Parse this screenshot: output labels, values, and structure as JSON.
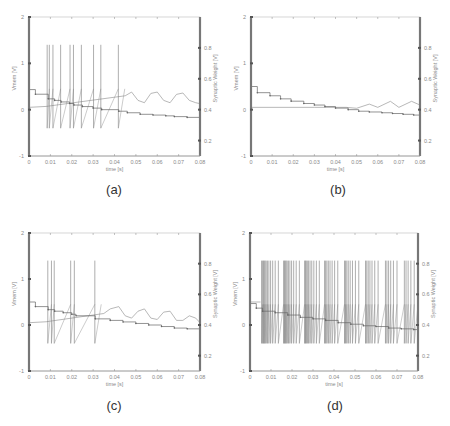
{
  "figure": {
    "captions": [
      "(a)",
      "(b)",
      "(c)",
      "(d)"
    ]
  },
  "chart_data": [
    {
      "id": "a",
      "type": "line",
      "caption": "(a)",
      "xlabel": "time [s]",
      "ylabel": "Vmem [V]",
      "ylabel_right": "Synaptic Weight [V]",
      "xlim": [
        0,
        0.08
      ],
      "ylim": [
        -1,
        2
      ],
      "ylim_right": [
        0.1,
        1.0
      ],
      "xticks": [
        "0",
        "0.01",
        "0.02",
        "0.03",
        "0.04",
        "0.05",
        "0.06",
        "0.07",
        "0.08"
      ],
      "yticks": [
        "-1",
        "0",
        "1",
        "2"
      ],
      "yticks_right": [
        "0.2",
        "0.4",
        "0.6",
        "0.8"
      ],
      "grid": false,
      "legend": null,
      "series": [
        {
          "name": "Vmem",
          "axis": "left",
          "spike_times": [
            0.0085,
            0.0095,
            0.0112,
            0.0148,
            0.0192,
            0.0208,
            0.0245,
            0.0302,
            0.0336,
            0.0418
          ],
          "spike_peak": 1.4,
          "spike_trough": -0.4,
          "baseline": [
            [
              0,
              0.05
            ],
            [
              0.008,
              0.07
            ],
            [
              0.045,
              0.3
            ],
            [
              0.048,
              0.38
            ],
            [
              0.051,
              0.2
            ],
            [
              0.054,
              0.15
            ],
            [
              0.057,
              0.35
            ],
            [
              0.06,
              0.38
            ],
            [
              0.063,
              0.2
            ],
            [
              0.066,
              0.15
            ],
            [
              0.069,
              0.33
            ],
            [
              0.072,
              0.36
            ],
            [
              0.075,
              0.2
            ],
            [
              0.078,
              0.15
            ],
            [
              0.08,
              0.13
            ]
          ]
        },
        {
          "name": "Synaptic Weight",
          "axis": "right",
          "steps": [
            [
              0,
              0.53
            ],
            [
              0.003,
              0.5
            ],
            [
              0.009,
              0.47
            ],
            [
              0.012,
              0.46
            ],
            [
              0.015,
              0.45
            ],
            [
              0.019,
              0.44
            ],
            [
              0.021,
              0.43
            ],
            [
              0.025,
              0.42
            ],
            [
              0.03,
              0.41
            ],
            [
              0.034,
              0.4
            ],
            [
              0.042,
              0.39
            ],
            [
              0.046,
              0.38
            ],
            [
              0.052,
              0.37
            ],
            [
              0.058,
              0.365
            ],
            [
              0.064,
              0.36
            ],
            [
              0.068,
              0.355
            ],
            [
              0.074,
              0.35
            ],
            [
              0.08,
              0.345
            ]
          ]
        }
      ]
    },
    {
      "id": "b",
      "type": "line",
      "caption": "(b)",
      "xlabel": "time [s]",
      "ylabel": "Vmem [V]",
      "ylabel_right": "Synaptic Weight [V]",
      "xlim": [
        0,
        0.08
      ],
      "ylim": [
        -1,
        2
      ],
      "ylim_right": [
        0.1,
        1.0
      ],
      "xticks": [
        "0",
        "0.01",
        "0.02",
        "0.03",
        "0.04",
        "0.05",
        "0.06",
        "0.07",
        "0.08"
      ],
      "yticks": [
        "-1",
        "0",
        "1",
        "2"
      ],
      "yticks_right": [
        "0.2",
        "0.4",
        "0.6",
        "0.8"
      ],
      "grid": false,
      "legend": null,
      "series": [
        {
          "name": "Vmem",
          "axis": "left",
          "spike_times": [],
          "spike_peak": 1.4,
          "spike_trough": -0.4,
          "baseline": [
            [
              0,
              0.05
            ],
            [
              0.03,
              0.05
            ],
            [
              0.045,
              0.05
            ],
            [
              0.05,
              0.03
            ],
            [
              0.056,
              0.12
            ],
            [
              0.06,
              0.05
            ],
            [
              0.066,
              0.18
            ],
            [
              0.07,
              0.05
            ],
            [
              0.076,
              0.18
            ],
            [
              0.08,
              0.1
            ]
          ]
        },
        {
          "name": "Synaptic Weight",
          "axis": "right",
          "steps": [
            [
              0,
              0.55
            ],
            [
              0.003,
              0.51
            ],
            [
              0.009,
              0.49
            ],
            [
              0.014,
              0.47
            ],
            [
              0.019,
              0.455
            ],
            [
              0.025,
              0.44
            ],
            [
              0.03,
              0.43
            ],
            [
              0.035,
              0.42
            ],
            [
              0.04,
              0.41
            ],
            [
              0.046,
              0.4
            ],
            [
              0.051,
              0.39
            ],
            [
              0.056,
              0.385
            ],
            [
              0.062,
              0.38
            ],
            [
              0.067,
              0.375
            ],
            [
              0.072,
              0.37
            ],
            [
              0.077,
              0.365
            ],
            [
              0.08,
              0.36
            ]
          ]
        }
      ]
    },
    {
      "id": "c",
      "type": "line",
      "caption": "(c)",
      "xlabel": "time [s]",
      "ylabel": "Vmem [V]",
      "ylabel_right": "Synaptic Weight [V]",
      "xlim": [
        0,
        0.08
      ],
      "ylim": [
        -1,
        2
      ],
      "ylim_right": [
        0.1,
        1.0
      ],
      "xticks": [
        "0",
        "0.01",
        "0.02",
        "0.03",
        "0.04",
        "0.05",
        "0.06",
        "0.07",
        "0.08"
      ],
      "yticks": [
        "-1",
        "0",
        "1",
        "2"
      ],
      "yticks_right": [
        "0.2",
        "0.4",
        "0.6",
        "0.8"
      ],
      "grid": false,
      "legend": null,
      "series": [
        {
          "name": "Vmem",
          "axis": "left",
          "spike_times": [
            0.0088,
            0.0105,
            0.0118,
            0.0195,
            0.0212,
            0.0308
          ],
          "spike_peak": 1.4,
          "spike_trough": -0.4,
          "baseline": [
            [
              0,
              0.05
            ],
            [
              0.008,
              0.07
            ],
            [
              0.035,
              0.25
            ],
            [
              0.038,
              0.35
            ],
            [
              0.042,
              0.4
            ],
            [
              0.045,
              0.2
            ],
            [
              0.048,
              0.15
            ],
            [
              0.051,
              0.3
            ],
            [
              0.054,
              0.35
            ],
            [
              0.057,
              0.15
            ],
            [
              0.06,
              0.12
            ],
            [
              0.063,
              0.28
            ],
            [
              0.066,
              0.3
            ],
            [
              0.069,
              0.1
            ],
            [
              0.072,
              0.1
            ],
            [
              0.075,
              0.2
            ],
            [
              0.078,
              0.15
            ],
            [
              0.08,
              0.05
            ]
          ]
        },
        {
          "name": "Synaptic Weight",
          "axis": "right",
          "steps": [
            [
              0,
              0.55
            ],
            [
              0.003,
              0.52
            ],
            [
              0.009,
              0.5
            ],
            [
              0.012,
              0.49
            ],
            [
              0.016,
              0.48
            ],
            [
              0.02,
              0.47
            ],
            [
              0.022,
              0.46
            ],
            [
              0.031,
              0.44
            ],
            [
              0.038,
              0.43
            ],
            [
              0.044,
              0.42
            ],
            [
              0.05,
              0.41
            ],
            [
              0.056,
              0.4
            ],
            [
              0.062,
              0.39
            ],
            [
              0.068,
              0.38
            ],
            [
              0.074,
              0.375
            ],
            [
              0.08,
              0.37
            ]
          ]
        }
      ]
    },
    {
      "id": "d",
      "type": "line",
      "caption": "(d)",
      "xlabel": "time [s]",
      "ylabel": "Vmem [V]",
      "ylabel_right": "Synaptic Weight [V]",
      "xlim": [
        0,
        0.08
      ],
      "ylim": [
        -1,
        2
      ],
      "ylim_right": [
        0.1,
        1.0
      ],
      "xticks": [
        "0",
        "0.01",
        "0.02",
        "0.03",
        "0.04",
        "0.05",
        "0.06",
        "0.07",
        "0.08"
      ],
      "yticks": [
        "-1",
        "0",
        "1",
        "2"
      ],
      "yticks_right": [
        "0.2",
        "0.4",
        "0.6",
        "0.8"
      ],
      "grid": false,
      "legend": null,
      "series": [
        {
          "name": "Vmem",
          "axis": "left",
          "spike_times": [
            0.0055,
            0.006,
            0.0064,
            0.0068,
            0.0072,
            0.0077,
            0.0083,
            0.009,
            0.0098,
            0.0108,
            0.012,
            0.0135,
            0.016,
            0.0164,
            0.0168,
            0.0172,
            0.0177,
            0.0183,
            0.019,
            0.0198,
            0.0208,
            0.022,
            0.0235,
            0.026,
            0.0264,
            0.0268,
            0.0273,
            0.0279,
            0.0286,
            0.0294,
            0.0304,
            0.0316,
            0.033,
            0.0355,
            0.036,
            0.0366,
            0.0373,
            0.0381,
            0.0391,
            0.0403,
            0.0418,
            0.045,
            0.0455,
            0.0461,
            0.0468,
            0.0477,
            0.0488,
            0.0502,
            0.0518,
            0.055,
            0.0556,
            0.0563,
            0.0571,
            0.0581,
            0.0594,
            0.061,
            0.0645,
            0.0652,
            0.066,
            0.067,
            0.0683,
            0.07,
            0.0735,
            0.0743,
            0.0753,
            0.0766,
            0.0782
          ],
          "spike_peak": 1.4,
          "spike_trough": -0.4,
          "baseline": [
            [
              0,
              0.5
            ],
            [
              0.005,
              0.5
            ]
          ]
        },
        {
          "name": "Synaptic Weight",
          "axis": "right",
          "steps": [
            [
              0,
              0.54
            ],
            [
              0.003,
              0.51
            ],
            [
              0.006,
              0.49
            ],
            [
              0.012,
              0.48
            ],
            [
              0.018,
              0.465
            ],
            [
              0.024,
              0.45
            ],
            [
              0.03,
              0.44
            ],
            [
              0.036,
              0.43
            ],
            [
              0.042,
              0.415
            ],
            [
              0.048,
              0.405
            ],
            [
              0.054,
              0.395
            ],
            [
              0.06,
              0.39
            ],
            [
              0.066,
              0.38
            ],
            [
              0.072,
              0.375
            ],
            [
              0.078,
              0.37
            ],
            [
              0.08,
              0.365
            ]
          ]
        }
      ]
    }
  ]
}
